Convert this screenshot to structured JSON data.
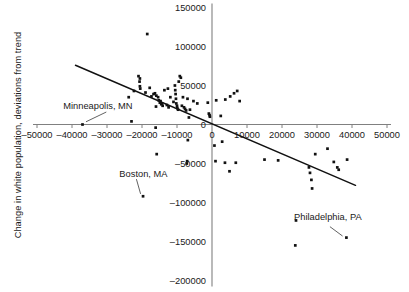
{
  "chart_data": {
    "type": "scatter",
    "title": "",
    "xlabel": "",
    "ylabel": "Change in white population, deviations from trend",
    "xlim": [
      -50000,
      50000
    ],
    "ylim": [
      -200000,
      150000
    ],
    "xticks": [
      -50000,
      -40000,
      -30000,
      -20000,
      -10000,
      0,
      10000,
      20000,
      30000,
      40000,
      50000
    ],
    "xtick_labels": [
      "–50000",
      "–40000",
      "–30000",
      "–20000",
      "–10000",
      "0",
      "10000",
      "20000",
      "30000",
      "40000",
      "50000"
    ],
    "yticks": [
      150000,
      100000,
      50000,
      0,
      -50000,
      -100000,
      -150000,
      -200000
    ],
    "ytick_labels": [
      "150000",
      "100000",
      "50000",
      "0",
      "–50000",
      "–100000",
      "–150000",
      "–200000"
    ],
    "grid": false,
    "legend": null,
    "legend_position": "none",
    "series": [
      {
        "name": "Metro areas",
        "marker": "square-dot",
        "color": "#111111",
        "points": [
          [
            -18500,
            116000
          ],
          [
            -22300,
            43000
          ],
          [
            -21000,
            62000
          ],
          [
            -20700,
            55000
          ],
          [
            -20600,
            49000
          ],
          [
            -20500,
            46000
          ],
          [
            -20600,
            59000
          ],
          [
            -23800,
            35000
          ],
          [
            -23000,
            4000
          ],
          [
            -19000,
            41000
          ],
          [
            -17800,
            47000
          ],
          [
            -17300,
            36000
          ],
          [
            -16700,
            39000
          ],
          [
            -16300,
            40000
          ],
          [
            -16000,
            23000
          ],
          [
            -15900,
            37000
          ],
          [
            -15400,
            35000
          ],
          [
            -15200,
            31000
          ],
          [
            -14900,
            28000
          ],
          [
            -14700,
            30000
          ],
          [
            -14500,
            26000
          ],
          [
            -14300,
            27000
          ],
          [
            -14100,
            24000
          ],
          [
            -13600,
            44000
          ],
          [
            -12900,
            25000
          ],
          [
            -12600,
            46000
          ],
          [
            -12400,
            22000
          ],
          [
            -11900,
            35000
          ],
          [
            -11000,
            29000
          ],
          [
            -10600,
            50000
          ],
          [
            -10500,
            44000
          ],
          [
            -10400,
            39000
          ],
          [
            -10300,
            33000
          ],
          [
            -10200,
            27000
          ],
          [
            -10000,
            24000
          ],
          [
            -9900,
            21000
          ],
          [
            -9700,
            19000
          ],
          [
            -9500,
            55000
          ],
          [
            -9200,
            62000
          ],
          [
            -8900,
            60000
          ],
          [
            -8600,
            24000
          ],
          [
            -8300,
            35000
          ],
          [
            -8000,
            22000
          ],
          [
            -7700,
            20000
          ],
          [
            -7400,
            18000
          ],
          [
            -7000,
            33000
          ],
          [
            -6600,
            9000
          ],
          [
            -6300,
            19000
          ],
          [
            -5300,
            30000
          ],
          [
            -4200,
            27000
          ],
          [
            -1200,
            28000
          ],
          [
            -900,
            14000
          ],
          [
            -700,
            12000
          ],
          [
            -600,
            10000
          ],
          [
            1200,
            31000
          ],
          [
            2500,
            11000
          ],
          [
            3800,
            32000
          ],
          [
            5200,
            36000
          ],
          [
            6300,
            40000
          ],
          [
            7200,
            43000
          ],
          [
            7900,
            30000
          ],
          [
            -37000,
            0
          ],
          [
            -16100,
            -4000
          ],
          [
            -6900,
            -20000
          ],
          [
            -15800,
            -38000
          ],
          [
            -7100,
            -47000
          ],
          [
            -7200,
            -50000
          ],
          [
            700,
            -27000
          ],
          [
            1000,
            -47000
          ],
          [
            2900,
            -22000
          ],
          [
            3700,
            -49000
          ],
          [
            5000,
            -60000
          ],
          [
            6800,
            -49000
          ],
          [
            15000,
            -45000
          ],
          [
            18900,
            -46000
          ],
          [
            23800,
            -155000
          ],
          [
            24000,
            -123000
          ],
          [
            27700,
            -55000
          ],
          [
            28000,
            -62000
          ],
          [
            28400,
            -71000
          ],
          [
            28600,
            -82000
          ],
          [
            29500,
            -38000
          ],
          [
            33000,
            -31000
          ],
          [
            34800,
            -48000
          ],
          [
            35800,
            -55000
          ],
          [
            36200,
            -58000
          ],
          [
            38400,
            -145000
          ],
          [
            38600,
            -45000
          ],
          [
            -19700,
            -92000
          ]
        ]
      }
    ],
    "trend_line": {
      "name": "fitted trend",
      "x_start": -39000,
      "y_start": 76000,
      "x_end": 41000,
      "y_end": -78000,
      "color": "#111111"
    },
    "annotations": [
      {
        "label": "Minneapolis, MN",
        "label_x": -32600,
        "label_y": 24000,
        "point_x": -37000,
        "point_y": 0,
        "leader_from_x": -30200,
        "leader_from_y": 16000,
        "leader_to_x": -36000,
        "leader_to_y": 3500
      },
      {
        "label": "Boston, MA",
        "label_x": -19600,
        "label_y": -63000,
        "point_x": -19700,
        "point_y": -92000,
        "leader_from_x": -21600,
        "leader_from_y": -70000,
        "leader_to_x": -20400,
        "leader_to_y": -89000
      },
      {
        "label": "Philadelphia, PA",
        "label_x": 33100,
        "label_y": -119000,
        "point_x": 38400,
        "point_y": -145000,
        "leader_from_x": 33700,
        "leader_from_y": -131000,
        "leader_to_x": 37300,
        "leader_to_y": -143000
      }
    ]
  }
}
